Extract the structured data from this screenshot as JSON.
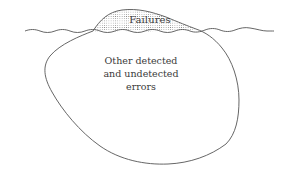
{
  "diagram": {
    "type": "iceberg",
    "tip_label": "Failures",
    "body_label": {
      "lines": [
        "Other detected",
        "and undetected",
        "errors"
      ]
    },
    "colors": {
      "outline": "#555555",
      "text": "#3a3a3a",
      "background": "#ffffff",
      "hatch": "#777777"
    }
  }
}
